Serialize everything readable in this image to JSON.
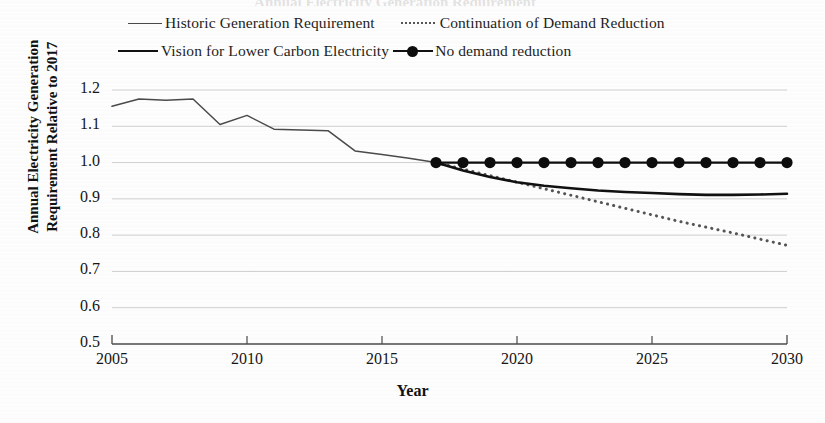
{
  "figure": {
    "ghost_title_fragment": "Annual Electricity Generation Requirement",
    "background_color": "#fdfdfd"
  },
  "legend": {
    "items": [
      {
        "label": "Historic Generation Requirement",
        "style": "solid-thin",
        "color": "#4a4a4a"
      },
      {
        "label": "Continuation of Demand Reduction",
        "style": "dotted",
        "color": "#555555"
      },
      {
        "label": "Vision for Lower Carbon Electricity",
        "style": "solid-thick",
        "color": "#111111"
      },
      {
        "label": "No demand reduction",
        "style": "line-marker",
        "color": "#0d0d0d"
      }
    ]
  },
  "axes": {
    "x_label": "Year",
    "y_label_line1": "Annual Electricity Generation",
    "y_label_line2": "Requirement Relative to 2017",
    "x_ticks": [
      "2005",
      "2010",
      "2015",
      "2020",
      "2025",
      "2030"
    ],
    "y_ticks": [
      "1.2",
      "1.1",
      "1.0",
      "0.9",
      "0.8",
      "0.7",
      "0.6",
      "0.5"
    ]
  },
  "chart_data": {
    "type": "line",
    "title": "Annual Electricity Generation Requirement Relative to 2017",
    "xlabel": "Year",
    "ylabel": "Annual Electricity Generation Requirement Relative to 2017",
    "xlim": [
      2005,
      2030
    ],
    "ylim": [
      0.5,
      1.2
    ],
    "grid": true,
    "grid_axis": "y",
    "legend_position": "top",
    "x": [
      2005,
      2006,
      2007,
      2008,
      2009,
      2010,
      2011,
      2012,
      2013,
      2014,
      2015,
      2016,
      2017,
      2018,
      2019,
      2020,
      2021,
      2022,
      2023,
      2024,
      2025,
      2026,
      2027,
      2028,
      2029,
      2030
    ],
    "series": [
      {
        "name": "Historic Generation Requirement",
        "style": "solid-thin",
        "color": "#4a4a4a",
        "x": [
          2005,
          2006,
          2007,
          2008,
          2009,
          2010,
          2011,
          2012,
          2013,
          2014,
          2015,
          2016,
          2017
        ],
        "values": [
          1.155,
          1.175,
          1.172,
          1.175,
          1.105,
          1.13,
          1.092,
          1.09,
          1.088,
          1.032,
          1.022,
          1.012,
          1.0
        ]
      },
      {
        "name": "Continuation of Demand Reduction",
        "style": "dotted",
        "color": "#555555",
        "x": [
          2017,
          2018,
          2019,
          2020,
          2021,
          2022,
          2023,
          2024,
          2025,
          2026,
          2027,
          2028,
          2029,
          2030
        ],
        "values": [
          1.0,
          0.982,
          0.964,
          0.946,
          0.928,
          0.91,
          0.892,
          0.874,
          0.856,
          0.838,
          0.822,
          0.806,
          0.789,
          0.772
        ]
      },
      {
        "name": "Vision for Lower Carbon Electricity",
        "style": "solid-thick",
        "color": "#111111",
        "x": [
          2017,
          2018,
          2019,
          2020,
          2021,
          2022,
          2023,
          2024,
          2025,
          2026,
          2027,
          2028,
          2029,
          2030
        ],
        "values": [
          1.0,
          0.978,
          0.96,
          0.946,
          0.936,
          0.929,
          0.923,
          0.919,
          0.916,
          0.913,
          0.911,
          0.911,
          0.912,
          0.914
        ]
      },
      {
        "name": "No demand reduction",
        "style": "line-marker",
        "color": "#0d0d0d",
        "x": [
          2017,
          2018,
          2019,
          2020,
          2021,
          2022,
          2023,
          2024,
          2025,
          2026,
          2027,
          2028,
          2029,
          2030
        ],
        "values": [
          1.0,
          1.0,
          1.0,
          1.0,
          1.0,
          1.0,
          1.0,
          1.0,
          1.0,
          1.0,
          1.0,
          1.0,
          1.0,
          1.0
        ]
      }
    ]
  }
}
